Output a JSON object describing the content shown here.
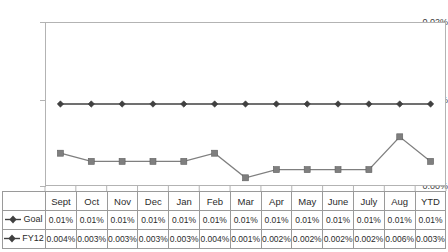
{
  "chart_data": {
    "type": "line",
    "title": "",
    "xlabel": "",
    "ylabel": "",
    "categories": [
      "Sept",
      "Oct",
      "Nov",
      "Dec",
      "Jan",
      "Feb",
      "Mar",
      "Apr",
      "May",
      "June",
      "July",
      "Aug",
      "YTD"
    ],
    "ylim": [
      0,
      0.02
    ],
    "y_ticks": [
      "0.00%",
      "0.01%",
      "0.02%"
    ],
    "y_tick_values": [
      0.0,
      0.01,
      0.02
    ],
    "grid": false,
    "legend_position": "table-left",
    "series": [
      {
        "name": "Goal",
        "marker": "diamond",
        "color": "#404040",
        "values": [
          0.01,
          0.01,
          0.01,
          0.01,
          0.01,
          0.01,
          0.01,
          0.01,
          0.01,
          0.01,
          0.01,
          0.01,
          0.01
        ],
        "labels": [
          "0.01%",
          "0.01%",
          "0.01%",
          "0.01%",
          "0.01%",
          "0.01%",
          "0.01%",
          "0.01%",
          "0.01%",
          "0.01%",
          "0.01%",
          "0.01%",
          "0.01%"
        ]
      },
      {
        "name": "FY12",
        "marker": "square",
        "color": "#7f7f7f",
        "values": [
          0.004,
          0.003,
          0.003,
          0.003,
          0.003,
          0.004,
          0.001,
          0.002,
          0.002,
          0.002,
          0.002,
          0.006,
          0.003
        ],
        "labels": [
          "0.004%",
          "0.003%",
          "0.003%",
          "0.003%",
          "0.003%",
          "0.004%",
          "0.001%",
          "0.002%",
          "0.002%",
          "0.002%",
          "0.002%",
          "0.006%",
          "0.003%"
        ]
      }
    ]
  },
  "table": {
    "header_corner": "",
    "columns": [
      "Sept",
      "Oct",
      "Nov",
      "Dec",
      "Jan",
      "Feb",
      "Mar",
      "Apr",
      "May",
      "June",
      "July",
      "Aug",
      "YTD"
    ],
    "rows": [
      {
        "label": "Goal",
        "marker": "diamond",
        "values": [
          "0.01%",
          "0.01%",
          "0.01%",
          "0.01%",
          "0.01%",
          "0.01%",
          "0.01%",
          "0.01%",
          "0.01%",
          "0.01%",
          "0.01%",
          "0.01%",
          "0.01%"
        ]
      },
      {
        "label": "FY12",
        "marker": "diamond",
        "values": [
          "0.004%",
          "0.003%",
          "0.003%",
          "0.003%",
          "0.003%",
          "0.004%",
          "0.001%",
          "0.002%",
          "0.002%",
          "0.002%",
          "0.002%",
          "0.006%",
          "0.003%"
        ]
      }
    ]
  },
  "axis": {
    "y_labels": [
      "0.02%",
      "0.01%",
      "0.00%"
    ]
  },
  "colors": {
    "goal_series": "#404040",
    "fy12_series": "#7f7f7f",
    "plot_border": "#b3b3b3",
    "table_border": "#9a9a9a",
    "text": "#2b2b2b"
  }
}
